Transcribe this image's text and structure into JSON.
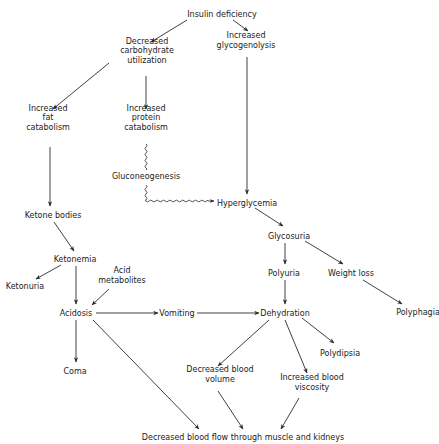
{
  "diagram": {
    "nodes": [
      {
        "id": "insulin_deficiency",
        "lines": [
          "Insulin deficiency"
        ],
        "x": 222,
        "y": 14
      },
      {
        "id": "decreased_carb",
        "lines": [
          "Decreased",
          "carbohydrate",
          "utilization"
        ],
        "x": 147,
        "y": 50
      },
      {
        "id": "increased_glycogenolysis",
        "lines": [
          "Increased",
          "glycogenolysis"
        ],
        "x": 246,
        "y": 40
      },
      {
        "id": "increased_fat_catabolism",
        "lines": [
          "Increased",
          "fat",
          "catabolism"
        ],
        "x": 48,
        "y": 117
      },
      {
        "id": "increased_protein_catabolism",
        "lines": [
          "Increased",
          "protein",
          "catabolism"
        ],
        "x": 146,
        "y": 117
      },
      {
        "id": "gluconeogenesis",
        "lines": [
          "Gluconeogenesis"
        ],
        "x": 146,
        "y": 176
      },
      {
        "id": "hyperglycemia",
        "lines": [
          "Hyperglycemia"
        ],
        "x": 247,
        "y": 203
      },
      {
        "id": "ketone_bodies",
        "lines": [
          "Ketone bodies"
        ],
        "x": 53,
        "y": 215
      },
      {
        "id": "glycosuria",
        "lines": [
          "Glycosuria"
        ],
        "x": 289,
        "y": 236
      },
      {
        "id": "ketonemia",
        "lines": [
          "Ketonemia"
        ],
        "x": 75,
        "y": 259
      },
      {
        "id": "polyuria",
        "lines": [
          "Polyuria"
        ],
        "x": 284,
        "y": 273
      },
      {
        "id": "weight_loss",
        "lines": [
          "Weight loss"
        ],
        "x": 351,
        "y": 273
      },
      {
        "id": "acid_metabolites",
        "lines": [
          "Acid",
          "metabolites"
        ],
        "x": 122,
        "y": 275
      },
      {
        "id": "ketonuria",
        "lines": [
          "Ketonuria"
        ],
        "x": 25,
        "y": 286
      },
      {
        "id": "acidosis",
        "lines": [
          "Acidosis"
        ],
        "x": 76,
        "y": 313
      },
      {
        "id": "vomiting",
        "lines": [
          "Vomiting"
        ],
        "x": 177,
        "y": 313
      },
      {
        "id": "dehydration",
        "lines": [
          "Dehydration"
        ],
        "x": 285,
        "y": 313
      },
      {
        "id": "polyphagia",
        "lines": [
          "Polyphagia"
        ],
        "x": 418,
        "y": 312
      },
      {
        "id": "polydipsia",
        "lines": [
          "Polydipsia"
        ],
        "x": 340,
        "y": 353
      },
      {
        "id": "coma",
        "lines": [
          "Coma"
        ],
        "x": 75,
        "y": 371
      },
      {
        "id": "decreased_blood_volume",
        "lines": [
          "Decreased blood",
          "volume"
        ],
        "x": 220,
        "y": 374
      },
      {
        "id": "increased_blood_viscosity",
        "lines": [
          "Increased blood",
          "viscosity"
        ],
        "x": 312,
        "y": 382
      },
      {
        "id": "decreased_blood_flow",
        "lines": [
          "Decreased blood flow through muscle and kidneys"
        ],
        "x": 243,
        "y": 437
      }
    ],
    "edges": [
      {
        "from": "insulin_deficiency",
        "to": "decreased_carb",
        "style": "arrow",
        "x1": 187,
        "y1": 20,
        "x2": 151,
        "y2": 42
      },
      {
        "from": "insulin_deficiency",
        "to": "increased_glycogenolysis",
        "style": "arrow",
        "x1": 233,
        "y1": 20,
        "x2": 248,
        "y2": 31
      },
      {
        "from": "decreased_carb",
        "to": "increased_fat_catabolism",
        "style": "arrow",
        "x1": 109,
        "y1": 63,
        "x2": 53,
        "y2": 109
      },
      {
        "from": "decreased_carb",
        "to": "increased_protein_catabolism",
        "style": "arrow",
        "x1": 146,
        "y1": 76,
        "x2": 146,
        "y2": 109
      },
      {
        "from": "increased_glycogenolysis",
        "to": "hyperglycemia",
        "style": "arrow",
        "x1": 247,
        "y1": 57,
        "x2": 247,
        "y2": 194
      },
      {
        "from": "increased_fat_catabolism",
        "to": "ketone_bodies",
        "style": "arrow",
        "x1": 50,
        "y1": 147,
        "x2": 50,
        "y2": 206
      },
      {
        "from": "increased_protein_catabolism",
        "to": "gluconeogenesis",
        "style": "wavy",
        "points": [
          [
            146,
            144
          ],
          [
            146,
            170
          ]
        ]
      },
      {
        "from": "gluconeogenesis",
        "to": "hyperglycemia",
        "style": "wavy-elbow",
        "points": [
          [
            146,
            185
          ],
          [
            146,
            201
          ],
          [
            214,
            201
          ]
        ]
      },
      {
        "from": "ketone_bodies",
        "to": "ketonemia",
        "style": "arrow",
        "x1": 54,
        "y1": 222,
        "x2": 74,
        "y2": 251
      },
      {
        "from": "ketonemia",
        "to": "ketonuria",
        "style": "arrow",
        "x1": 61,
        "y1": 265,
        "x2": 36,
        "y2": 279
      },
      {
        "from": "ketonemia",
        "to": "acidosis",
        "style": "arrow",
        "x1": 76,
        "y1": 266,
        "x2": 76,
        "y2": 304
      },
      {
        "from": "acid_metabolites",
        "to": "acidosis",
        "style": "arrow",
        "x1": 109,
        "y1": 289,
        "x2": 92,
        "y2": 305
      },
      {
        "from": "acidosis",
        "to": "vomiting",
        "style": "arrow",
        "x1": 96,
        "y1": 313,
        "x2": 158,
        "y2": 313
      },
      {
        "from": "acidosis",
        "to": "coma",
        "style": "arrow",
        "x1": 76,
        "y1": 320,
        "x2": 76,
        "y2": 362
      },
      {
        "from": "acidosis",
        "to": "decreased_blood_flow",
        "style": "arrow",
        "x1": 93,
        "y1": 320,
        "x2": 199,
        "y2": 429
      },
      {
        "from": "vomiting",
        "to": "dehydration",
        "style": "arrow",
        "x1": 197,
        "y1": 313,
        "x2": 259,
        "y2": 313
      },
      {
        "from": "hyperglycemia",
        "to": "glycosuria",
        "style": "arrow",
        "x1": 255,
        "y1": 208,
        "x2": 283,
        "y2": 226
      },
      {
        "from": "glycosuria",
        "to": "polyuria",
        "style": "arrow",
        "x1": 285,
        "y1": 243,
        "x2": 285,
        "y2": 264
      },
      {
        "from": "glycosuria",
        "to": "weight_loss",
        "style": "arrow",
        "x1": 305,
        "y1": 241,
        "x2": 343,
        "y2": 264
      },
      {
        "from": "polyuria",
        "to": "dehydration",
        "style": "arrow",
        "x1": 285,
        "y1": 280,
        "x2": 285,
        "y2": 304
      },
      {
        "from": "weight_loss",
        "to": "polyphagia",
        "style": "arrow",
        "x1": 363,
        "y1": 280,
        "x2": 402,
        "y2": 304
      },
      {
        "from": "dehydration",
        "to": "decreased_blood_volume",
        "style": "arrow",
        "x1": 269,
        "y1": 320,
        "x2": 218,
        "y2": 366
      },
      {
        "from": "dehydration",
        "to": "increased_blood_viscosity",
        "style": "arrow",
        "x1": 285,
        "y1": 320,
        "x2": 307,
        "y2": 373
      },
      {
        "from": "dehydration",
        "to": "polydipsia",
        "style": "arrow",
        "x1": 302,
        "y1": 318,
        "x2": 334,
        "y2": 343
      },
      {
        "from": "decreased_blood_volume",
        "to": "decreased_blood_flow",
        "style": "arrow",
        "x1": 218,
        "y1": 391,
        "x2": 243,
        "y2": 429
      },
      {
        "from": "increased_blood_viscosity",
        "to": "decreased_blood_flow",
        "style": "arrow",
        "x1": 299,
        "y1": 398,
        "x2": 281,
        "y2": 429
      }
    ]
  }
}
